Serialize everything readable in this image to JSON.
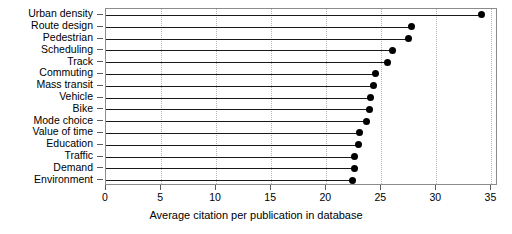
{
  "chart_data": {
    "type": "bar",
    "subtype": "lollipop-horizontal",
    "title": "",
    "xlabel": "Average citation per publication in database",
    "ylabel": "",
    "xlim": [
      0,
      35.6
    ],
    "ylim": [
      0,
      15
    ],
    "grid": "vertical-dotted",
    "legend": "none",
    "orientation": "horizontal",
    "xticks": [
      0,
      5,
      10,
      15,
      20,
      25,
      30,
      35
    ],
    "xticklabels": [
      "0",
      "5",
      "10",
      "15",
      "20",
      "25",
      "30",
      "35"
    ],
    "categories": [
      "Urban density",
      "Route design",
      "Pedestrian",
      "Scheduling",
      "Track",
      "Commuting",
      "Mass transit",
      "Vehicle",
      "Bike",
      "Mode choice",
      "Value of time",
      "Education",
      "Traffic",
      "Demand",
      "Environment"
    ],
    "values": [
      34.1,
      27.7,
      27.5,
      26.0,
      25.6,
      24.5,
      24.3,
      24.0,
      23.9,
      23.7,
      23.0,
      22.9,
      22.6,
      22.6,
      22.4
    ],
    "marker": "filled-circle",
    "marker_color": "#000000",
    "stem_color": "#1a1a1a",
    "grid_color": "#b4b4b4",
    "frame_color": "#8c8c8c"
  }
}
